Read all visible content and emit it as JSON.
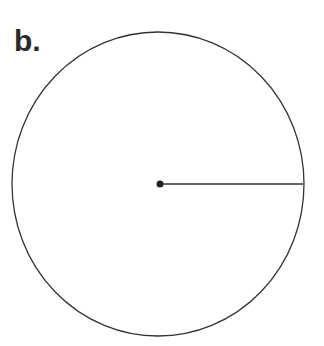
{
  "figure": {
    "label": "b.",
    "shape": "circle",
    "center": {
      "x": 158,
      "y": 184
    },
    "radius_x": 146,
    "radius_y": 152,
    "radius_line_end": {
      "x": 303,
      "y": 184
    },
    "stroke_color": "#333333",
    "dot_color": "#222222"
  }
}
